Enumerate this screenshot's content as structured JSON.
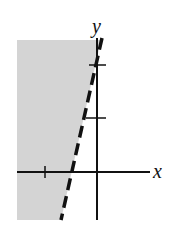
{
  "graph": {
    "x_label": "x",
    "y_label": "y",
    "boundary": "dashed line through (-0.5, 0) with steep positive slope",
    "shaded_region": "left of the line",
    "x_ticks": [
      -1
    ],
    "y_ticks": [
      1,
      2
    ],
    "colors": {
      "shade": "#d4d4d4",
      "line": "#111111"
    }
  }
}
